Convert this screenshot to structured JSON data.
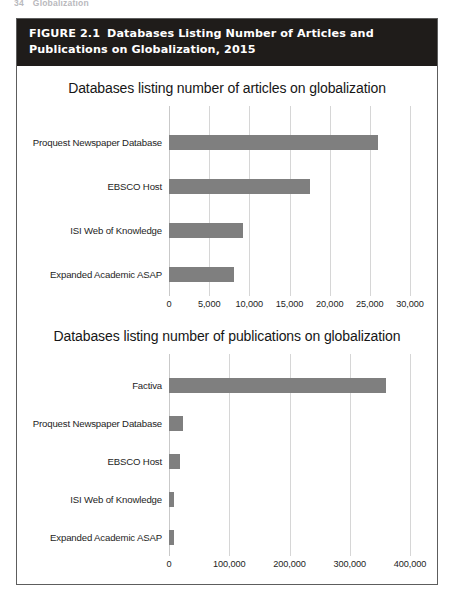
{
  "running_head": {
    "page_number": "34",
    "title": "Globalization"
  },
  "figure": {
    "number_label": "FIGURE 2.1",
    "caption": "Databases Listing Number of Articles and Publications on Globalization, 2015",
    "frame_color": "#5d5d5d",
    "caption_bg": "#1f1c1a",
    "caption_fg": "#ffffff"
  },
  "chart_data": [
    {
      "type": "bar",
      "orientation": "horizontal",
      "title": "Databases listing number of articles on globalization",
      "xlabel": "",
      "ylabel": "",
      "categories": [
        "Proquest Newspaper Database",
        "EBSCO Host",
        "ISI Web of Knowledge",
        "Expanded Academic ASAP"
      ],
      "values": [
        26000,
        17500,
        9200,
        8100
      ],
      "xlim": [
        0,
        30000
      ],
      "xticks": [
        0,
        5000,
        10000,
        15000,
        20000,
        25000,
        30000
      ],
      "xtick_labels": [
        "0",
        "5,000",
        "10,000",
        "15,000",
        "20,000",
        "25,000",
        "30,000"
      ],
      "grid": true,
      "legend": false,
      "bar_color": "#7f7f7f"
    },
    {
      "type": "bar",
      "orientation": "horizontal",
      "title": "Databases listing number of publications on globalization",
      "xlabel": "",
      "ylabel": "",
      "categories": [
        "Factiva",
        "Proquest Newspaper Database",
        "EBSCO Host",
        "ISI Web of Knowledge",
        "Expanded Academic ASAP"
      ],
      "values": [
        360000,
        23000,
        18000,
        8000,
        8000
      ],
      "xlim": [
        0,
        400000
      ],
      "xticks": [
        0,
        100000,
        200000,
        300000,
        400000
      ],
      "xtick_labels": [
        "0",
        "100,000",
        "200,000",
        "300,000",
        "400,000"
      ],
      "grid": true,
      "legend": false,
      "bar_color": "#7f7f7f"
    }
  ]
}
